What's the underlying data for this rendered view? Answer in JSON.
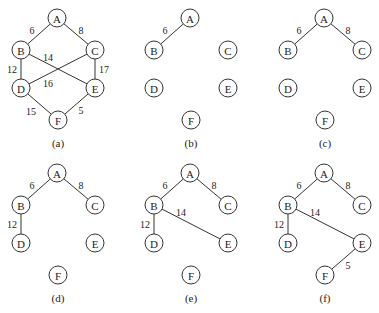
{
  "figure": {
    "node_radius": 9,
    "nodes": {
      "A": [
        57,
        18
      ],
      "B": [
        21,
        50
      ],
      "C": [
        95,
        50
      ],
      "D": [
        21,
        88
      ],
      "E": [
        95,
        88
      ],
      "F": [
        58,
        120
      ]
    },
    "caption_y": 143,
    "panels": [
      {
        "id": "a",
        "caption": "(a)",
        "dx": 0,
        "dy": 0,
        "edges": [
          {
            "from": "A",
            "to": "B",
            "w": "6",
            "lx": 32,
            "ly": 30
          },
          {
            "from": "A",
            "to": "C",
            "w": "8",
            "lx": 81,
            "ly": 30
          },
          {
            "from": "B",
            "to": "D",
            "w": "12",
            "lx": 12,
            "ly": 69
          },
          {
            "from": "B",
            "to": "E",
            "w": "14",
            "lx": 48,
            "ly": 57
          },
          {
            "from": "C",
            "to": "D",
            "w": "16",
            "lx": 48,
            "ly": 83
          },
          {
            "from": "C",
            "to": "E",
            "w": "17",
            "lx": 104,
            "ly": 69
          },
          {
            "from": "D",
            "to": "F",
            "w": "15",
            "lx": 31,
            "ly": 111
          },
          {
            "from": "E",
            "to": "F",
            "w": "5",
            "lx": 81,
            "ly": 110
          }
        ]
      },
      {
        "id": "b",
        "caption": "(b)",
        "dx": 133,
        "dy": 0,
        "edges": [
          {
            "from": "A",
            "to": "B",
            "w": "6",
            "lx": 32,
            "ly": 30
          }
        ]
      },
      {
        "id": "c",
        "caption": "(c)",
        "dx": 267,
        "dy": 0,
        "edges": [
          {
            "from": "A",
            "to": "B",
            "w": "6",
            "lx": 32,
            "ly": 30
          },
          {
            "from": "A",
            "to": "C",
            "w": "8",
            "lx": 81,
            "ly": 30
          }
        ]
      },
      {
        "id": "d",
        "caption": "(d)",
        "dx": 0,
        "dy": 155,
        "edges": [
          {
            "from": "A",
            "to": "B",
            "w": "6",
            "lx": 32,
            "ly": 30
          },
          {
            "from": "A",
            "to": "C",
            "w": "8",
            "lx": 81,
            "ly": 30
          },
          {
            "from": "B",
            "to": "D",
            "w": "12",
            "lx": 12,
            "ly": 69
          }
        ]
      },
      {
        "id": "e",
        "caption": "(e)",
        "dx": 133,
        "dy": 155,
        "edges": [
          {
            "from": "A",
            "to": "B",
            "w": "6",
            "lx": 32,
            "ly": 30
          },
          {
            "from": "A",
            "to": "C",
            "w": "8",
            "lx": 81,
            "ly": 30
          },
          {
            "from": "B",
            "to": "D",
            "w": "12",
            "lx": 12,
            "ly": 69
          },
          {
            "from": "B",
            "to": "E",
            "w": "14",
            "lx": 48,
            "ly": 57
          }
        ]
      },
      {
        "id": "f",
        "caption": "(f)",
        "dx": 267,
        "dy": 155,
        "edges": [
          {
            "from": "A",
            "to": "B",
            "w": "6",
            "lx": 32,
            "ly": 30
          },
          {
            "from": "A",
            "to": "C",
            "w": "8",
            "lx": 81,
            "ly": 30
          },
          {
            "from": "B",
            "to": "D",
            "w": "12",
            "lx": 12,
            "ly": 69
          },
          {
            "from": "B",
            "to": "E",
            "w": "14",
            "lx": 48,
            "ly": 57
          },
          {
            "from": "E",
            "to": "F",
            "w": "5",
            "lx": 81,
            "ly": 110
          }
        ]
      }
    ]
  }
}
